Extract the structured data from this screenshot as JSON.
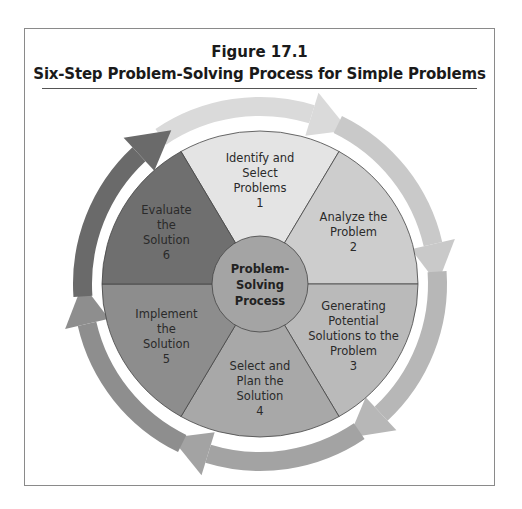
{
  "figure": {
    "number": "Figure 17.1",
    "title": "Six-Step Problem-Solving Process for Simple Problems"
  },
  "diagram": {
    "center": {
      "lines": [
        "Problem-",
        "Solving",
        "Process"
      ],
      "color": "#a4a4a4"
    },
    "steps": [
      {
        "step": 1,
        "lines": [
          "Identify and",
          "Select",
          "Problems",
          "1"
        ],
        "color": "#e4e4e4"
      },
      {
        "step": 2,
        "lines": [
          "Analyze the",
          "Problem",
          "2"
        ],
        "color": "#cdcdcd"
      },
      {
        "step": 3,
        "lines": [
          "Generating",
          "Potential",
          "Solutions to the",
          "Problem",
          "3"
        ],
        "color": "#bababa"
      },
      {
        "step": 4,
        "lines": [
          "Select and",
          "Plan the",
          "Solution",
          "4"
        ],
        "color": "#a8a8a8"
      },
      {
        "step": 5,
        "lines": [
          "Implement",
          "the",
          "Solution",
          "5"
        ],
        "color": "#8d8d8d"
      },
      {
        "step": 6,
        "lines": [
          "Evaluate",
          "the",
          "Solution",
          "6"
        ],
        "color": "#6f6f6f"
      }
    ],
    "arrow_colors": [
      "#dadada",
      "#c9c9c9",
      "#b7b7b7",
      "#a3a3a3",
      "#8e8e8e",
      "#6a6a6a"
    ]
  }
}
